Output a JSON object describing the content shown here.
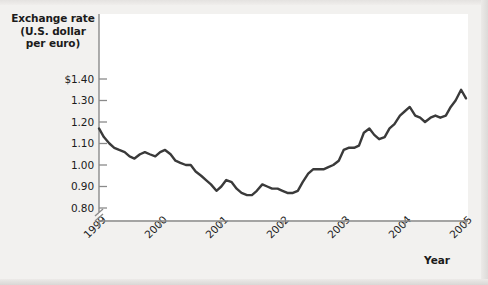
{
  "figure": {
    "background_color": "#f2f1ef",
    "plot_background_color": "#ffffff",
    "axis_color": "#7d7d7d",
    "line_color": "#3a3a3a",
    "text_color": "#1b1b1b"
  },
  "chart_data": {
    "type": "line",
    "title": "",
    "ylabel": "Exchange rate (U.S. dollar per euro)",
    "ylabel_lines": [
      "Exchange rate",
      "(U.S. dollar",
      "per euro)"
    ],
    "xlabel": "Year",
    "ylim": [
      0.78,
      1.44
    ],
    "ytick_labels": [
      "$1.40",
      "1.30",
      "1.20",
      "1.10",
      "1.00",
      "0.90",
      "0.80"
    ],
    "ytick_values": [
      1.4,
      1.3,
      1.2,
      1.1,
      1.0,
      0.9,
      0.8
    ],
    "xlim": [
      1999,
      2005
    ],
    "xtick_labels": [
      "1999",
      "2000",
      "2001",
      "2002",
      "2003",
      "2004",
      "2005"
    ],
    "xtick_values": [
      1999,
      2000,
      2001,
      2002,
      2003,
      2004,
      2005
    ],
    "y_axis_break": true,
    "grid": false,
    "legend": null,
    "series": [
      {
        "name": "U.S. dollars per euro",
        "x": [
          1999.0,
          1999.08,
          1999.17,
          1999.25,
          1999.33,
          1999.42,
          1999.5,
          1999.58,
          1999.67,
          1999.75,
          1999.83,
          1999.92,
          2000.0,
          2000.08,
          2000.17,
          2000.25,
          2000.33,
          2000.42,
          2000.5,
          2000.58,
          2000.67,
          2000.75,
          2000.83,
          2000.92,
          2001.0,
          2001.08,
          2001.17,
          2001.25,
          2001.33,
          2001.42,
          2001.5,
          2001.58,
          2001.67,
          2001.75,
          2001.83,
          2001.92,
          2002.0,
          2002.08,
          2002.17,
          2002.25,
          2002.33,
          2002.42,
          2002.5,
          2002.58,
          2002.67,
          2002.75,
          2002.83,
          2002.92,
          2003.0,
          2003.08,
          2003.17,
          2003.25,
          2003.33,
          2003.42,
          2003.5,
          2003.58,
          2003.67,
          2003.75,
          2003.83,
          2003.92,
          2004.0,
          2004.08,
          2004.17,
          2004.25,
          2004.33,
          2004.42,
          2004.5,
          2004.58,
          2004.67,
          2004.75,
          2004.83,
          2004.92,
          2005.0
        ],
        "y": [
          1.17,
          1.13,
          1.1,
          1.08,
          1.07,
          1.06,
          1.04,
          1.03,
          1.05,
          1.06,
          1.05,
          1.04,
          1.06,
          1.07,
          1.05,
          1.02,
          1.01,
          1.0,
          1.0,
          0.97,
          0.95,
          0.93,
          0.91,
          0.88,
          0.9,
          0.93,
          0.92,
          0.89,
          0.87,
          0.86,
          0.86,
          0.88,
          0.91,
          0.9,
          0.89,
          0.89,
          0.88,
          0.87,
          0.87,
          0.88,
          0.92,
          0.96,
          0.98,
          0.98,
          0.98,
          0.99,
          1.0,
          1.02,
          1.07,
          1.08,
          1.08,
          1.09,
          1.15,
          1.17,
          1.14,
          1.12,
          1.13,
          1.17,
          1.19,
          1.23,
          1.25,
          1.27,
          1.23,
          1.22,
          1.2,
          1.22,
          1.23,
          1.22,
          1.23,
          1.27,
          1.3,
          1.35,
          1.31
        ]
      }
    ]
  }
}
